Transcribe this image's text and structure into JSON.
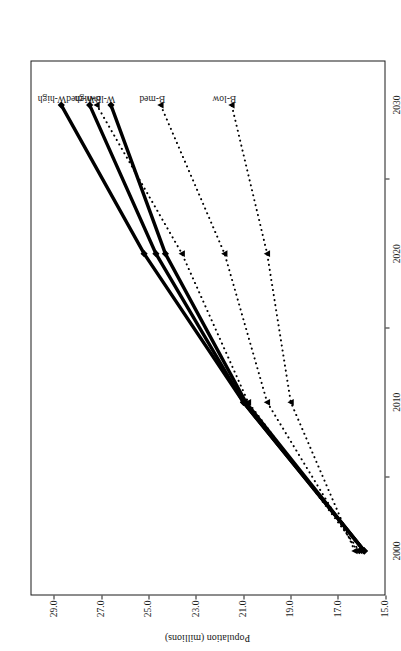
{
  "chart_data": {
    "type": "line",
    "title": "",
    "subtitle": "",
    "xlabel": "",
    "ylabel": "Population (millions)",
    "x": [
      2000,
      2010,
      2020,
      2030
    ],
    "xtick_labels": [
      "2000",
      "2010",
      "2020",
      "2030"
    ],
    "xtick_values": [
      2000,
      2010,
      2020,
      2030
    ],
    "x_minor_ticks": [
      2005,
      2015,
      2025
    ],
    "xlim": [
      1997,
      2033
    ],
    "ytick_labels": [
      "29.0",
      "27.0",
      "25.0",
      "23.0",
      "21.0",
      "19.0",
      "17.0",
      "15.0"
    ],
    "ytick_values": [
      29.0,
      27.0,
      25.0,
      23.0,
      21.0,
      19.0,
      17.0,
      15.0
    ],
    "ylim": [
      15.0,
      30.0
    ],
    "grid": false,
    "legend_position": "inline-end-of-line",
    "series": [
      {
        "name": "W-high",
        "label": "W-high",
        "style": "solid",
        "marker": "filled-diamond",
        "color": "#000000",
        "values": [
          15.9,
          21.0,
          25.2,
          28.7
        ]
      },
      {
        "name": "W-med",
        "label": "W-med",
        "style": "solid",
        "marker": "filled-diamond",
        "color": "#000000",
        "values": [
          15.9,
          21.0,
          24.7,
          27.5
        ]
      },
      {
        "name": "B-high",
        "label": "B-high",
        "style": "dotted",
        "marker": "filled-triangle",
        "color": "#000000",
        "values": [
          16.1,
          20.8,
          23.6,
          27.2
        ]
      },
      {
        "name": "W-low",
        "label": "W-low",
        "style": "solid",
        "marker": "filled-diamond",
        "color": "#000000",
        "values": [
          15.9,
          20.9,
          24.3,
          26.6
        ]
      },
      {
        "name": "B-med",
        "label": "B-med",
        "style": "dotted",
        "marker": "filled-triangle",
        "color": "#000000",
        "values": [
          16.2,
          20.0,
          21.8,
          24.5
        ]
      },
      {
        "name": "B-low",
        "label": "B-low",
        "style": "dotted",
        "marker": "filled-triangle",
        "color": "#000000",
        "values": [
          16.3,
          19.0,
          20.0,
          21.5
        ]
      }
    ]
  },
  "figure": {
    "background_color": "#ffffff",
    "axis_color": "#1a1a1a",
    "page_rotation_degrees": -90
  }
}
